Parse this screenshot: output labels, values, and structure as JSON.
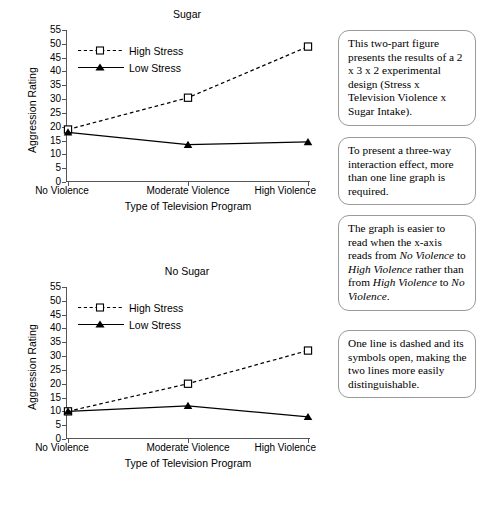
{
  "figure": {
    "axis_title_x": "Type of Television Program",
    "axis_title_y": "Aggression Rating",
    "categories": [
      "No Violence",
      "Moderate Violence",
      "High Violence"
    ],
    "y_ticks": [
      0,
      5,
      10,
      15,
      20,
      25,
      30,
      35,
      40,
      45,
      50,
      55
    ],
    "legend": [
      {
        "name": "High Stress",
        "style": "dashed-open-square"
      },
      {
        "name": "Low Stress",
        "style": "solid-filled-triangle"
      }
    ]
  },
  "chart_data": [
    {
      "type": "line",
      "title": "Sugar",
      "xlabel": "Type of Television Program",
      "ylabel": "Aggression Rating",
      "categories": [
        "No Violence",
        "Moderate Violence",
        "High Violence"
      ],
      "ylim": [
        0,
        55
      ],
      "yticks": [
        0,
        5,
        10,
        15,
        20,
        25,
        30,
        35,
        40,
        45,
        50,
        55
      ],
      "grid": false,
      "legend_position": "upper-left-inside",
      "series": [
        {
          "name": "High Stress",
          "values": [
            19,
            30.5,
            49
          ],
          "line": "dashed",
          "marker": "open-square"
        },
        {
          "name": "Low Stress",
          "values": [
            18,
            13.5,
            14.5
          ],
          "line": "solid",
          "marker": "filled-triangle"
        }
      ]
    },
    {
      "type": "line",
      "title": "No Sugar",
      "xlabel": "Type of Television Program",
      "ylabel": "Aggression Rating",
      "categories": [
        "No Violence",
        "Moderate Violence",
        "High Violence"
      ],
      "ylim": [
        0,
        55
      ],
      "yticks": [
        0,
        5,
        10,
        15,
        20,
        25,
        30,
        35,
        40,
        45,
        50,
        55
      ],
      "grid": false,
      "legend_position": "upper-left-inside",
      "series": [
        {
          "name": "High Stress",
          "values": [
            10,
            20,
            32
          ],
          "line": "dashed",
          "marker": "open-square"
        },
        {
          "name": "Low Stress",
          "values": [
            10,
            12,
            8
          ],
          "line": "solid",
          "marker": "filled-triangle"
        }
      ]
    }
  ],
  "callouts": [
    {
      "id": "callout-design",
      "text": "This two-part figure presents the results of a 2 x 3 x 2 experimental design (Stress x Television Violence x Sugar Intake)."
    },
    {
      "id": "callout-threeway",
      "text": "To present a three-way interaction effect, more than one line graph is required."
    },
    {
      "id": "callout-axis-order",
      "parts": [
        {
          "t": "The graph is easier to read when the x-axis reads from ",
          "i": false
        },
        {
          "t": "No Violence",
          "i": true
        },
        {
          "t": " to ",
          "i": false
        },
        {
          "t": "High Violence",
          "i": true
        },
        {
          "t": " rather than from ",
          "i": false
        },
        {
          "t": "High Violence",
          "i": true
        },
        {
          "t": " to ",
          "i": false
        },
        {
          "t": "No Violence",
          "i": true
        },
        {
          "t": ".",
          "i": false
        }
      ]
    },
    {
      "id": "callout-distinguish",
      "text": "One line is dashed and its symbols open, making the two lines more easily distinguishable."
    }
  ]
}
